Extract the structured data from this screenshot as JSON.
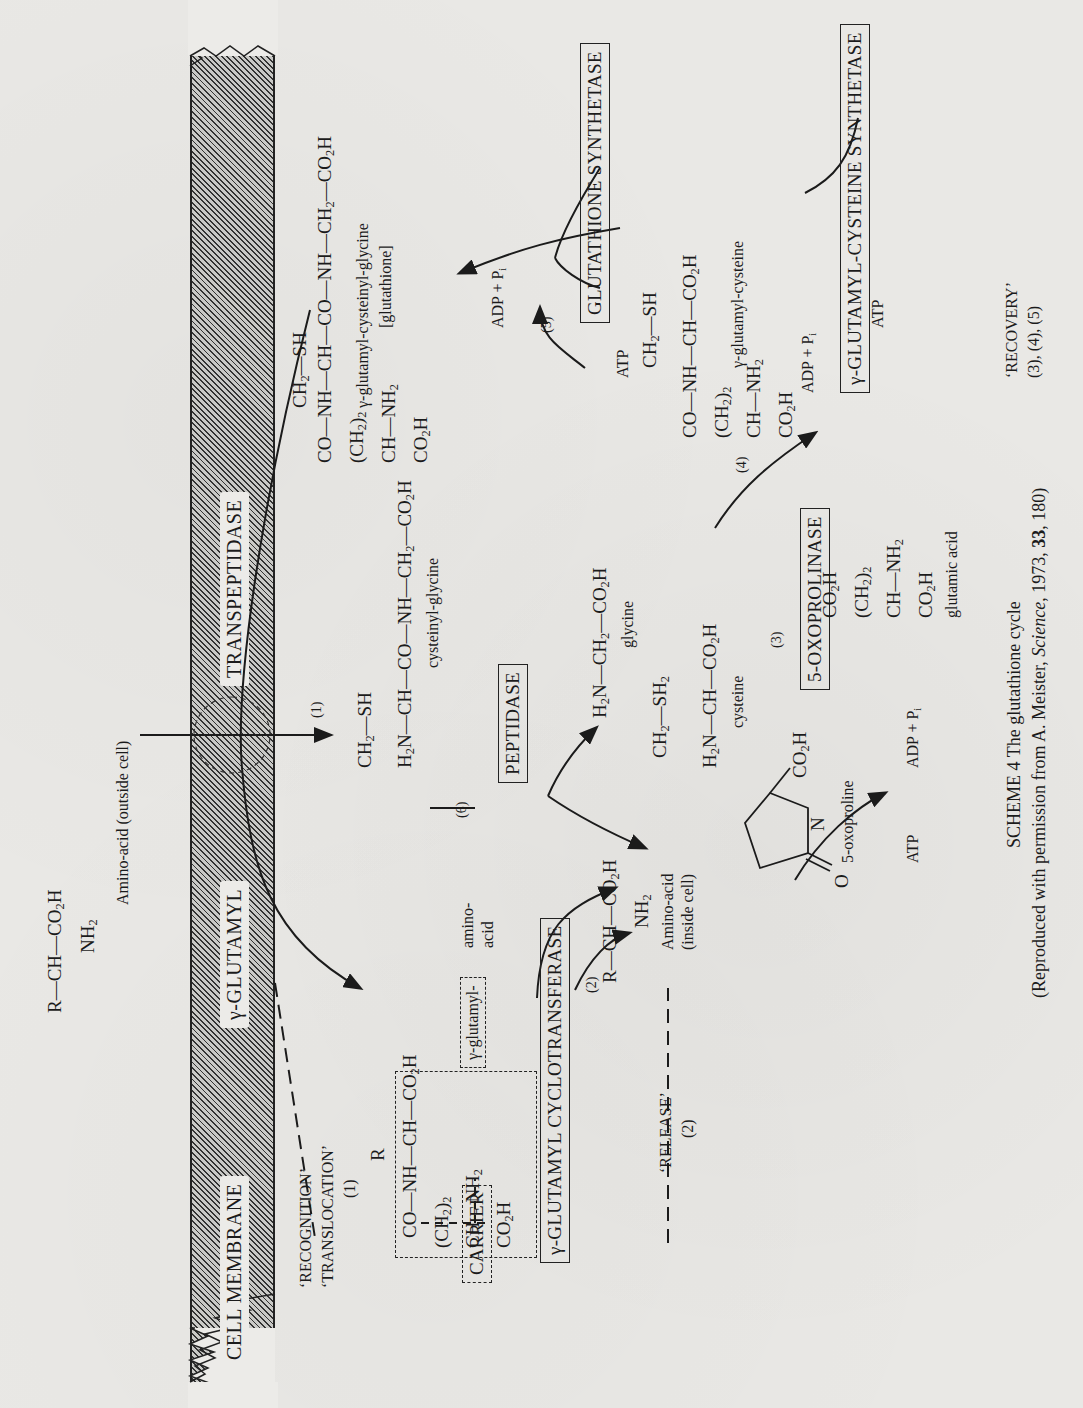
{
  "scheme": {
    "caption_title": "SCHEME 4 The glutathione cycle",
    "caption_source_prefix": "(Reproduced with permission from A. Meister, ",
    "caption_source_journal": "Science",
    "caption_source_year": ", 1973, ",
    "caption_source_volume": "33",
    "caption_source_pages": ", 180)"
  },
  "membrane": {
    "label_cell": "CELL MEMBRANE",
    "label_gamma": "γ-GLUTAMYL",
    "label_trans": "TRANSPEPTIDASE"
  },
  "phases": {
    "recognition": "‘RECOGNITION’",
    "translocation": "‘TRANSLOCATION’",
    "recognition_step": "(1)",
    "release": "‘RELEASE’",
    "release_step": "(2)",
    "recovery": "‘RECOVERY’",
    "recovery_steps": "(3), (4), (5)"
  },
  "enzymes": {
    "carrier": "CARRIER",
    "cyclotransferase": "γ-GLUTAMYL CYCLOTRANSFERASE",
    "peptidase": "PEPTIDASE",
    "oxoprolinase": "5-OXOPROLINASE",
    "gc_synthetase": "γ-GLUTAMYL-CYSTEINE SYNTHETASE",
    "gsh_synthetase": "GLUTATHIONE SYNTHETASE"
  },
  "step_numbers": {
    "s1": "(1)",
    "s2": "(2)",
    "s3": "(3)",
    "s4": "(4)",
    "s5": "(5)",
    "s6": "(6)"
  },
  "compounds": {
    "amino_outside_label": "Amino-acid (outside cell)",
    "amino_inside_label_1": "Amino-acid",
    "amino_inside_label_2": "(inside cell)",
    "gamma_glutamyl_amino_1": "γ-glutamyl-",
    "gamma_glutamyl_amino_2": "amino-",
    "gamma_glutamyl_amino_3": "acid",
    "cysteinyl_glycine": "cysteinyl-glycine",
    "glutathione_name": "γ-glutamyl-cysteinyl-glycine",
    "glutathione_alias": "[glutathione]",
    "glycine": "glycine",
    "cysteine": "cysteine",
    "gamma_glu_cys": "γ-glutamyl-cysteine",
    "oxoproline": "5-oxoproline",
    "glutamic_acid": "glutamic acid"
  },
  "cofactors": {
    "atp": "ATP",
    "adp_pi": "ADP + P"
  }
}
